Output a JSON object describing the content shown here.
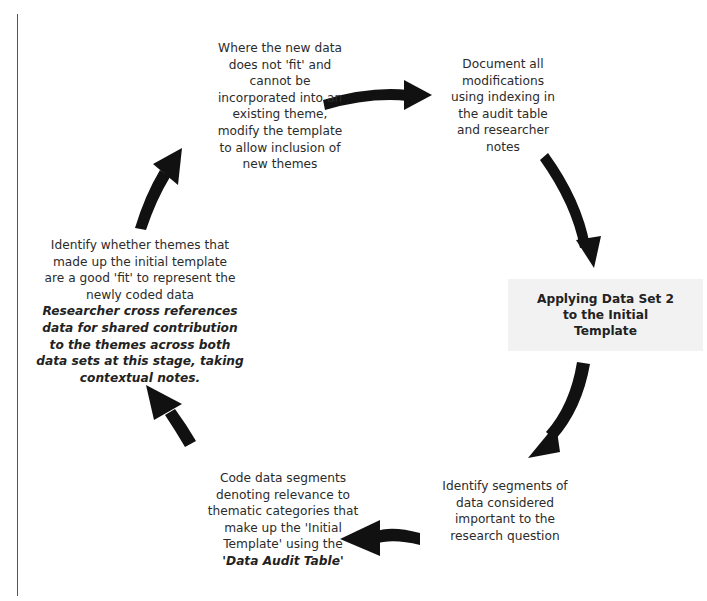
{
  "diagram": {
    "type": "cycle",
    "center_box": {
      "label": "Applying Data Set 2 to the Initial Template"
    },
    "nodes": [
      {
        "id": "modify-template",
        "lines": [
          "Where the new data",
          "does not 'fit' and",
          "cannot be",
          "incorporated into an",
          "existing theme,",
          "modify the template",
          "to allow inclusion of",
          "new themes"
        ]
      },
      {
        "id": "document-modifications",
        "lines": [
          "Document all",
          "modifications",
          "using indexing in",
          "the audit table",
          "and researcher",
          "notes"
        ]
      },
      {
        "id": "identify-segments",
        "lines": [
          "Identify segments of",
          "data considered",
          "important to the",
          "research question"
        ]
      },
      {
        "id": "code-segments",
        "lines": [
          "Code data segments",
          "denoting relevance to",
          "thematic categories that",
          "make up the 'Initial",
          "Template' using the"
        ],
        "emphasis": "'Data Audit Table'"
      },
      {
        "id": "identify-themes-fit",
        "lines": [
          "Identify whether themes that",
          "made up the initial template",
          "are a good 'fit' to represent the",
          "newly coded data"
        ],
        "emphasis_lines": [
          "Researcher cross references",
          "data for shared contribution",
          "to the themes across both",
          "data sets at this stage, taking",
          "contextual notes."
        ]
      }
    ],
    "arrows": [
      {
        "from": "modify-template",
        "to": "document-modifications",
        "direction": "right"
      },
      {
        "from": "document-modifications",
        "to": "center_box",
        "direction": "down"
      },
      {
        "from": "center_box",
        "to": "identify-segments",
        "direction": "down-left"
      },
      {
        "from": "identify-segments",
        "to": "code-segments",
        "direction": "left"
      },
      {
        "from": "code-segments",
        "to": "identify-themes-fit",
        "direction": "up-left"
      },
      {
        "from": "identify-themes-fit",
        "to": "modify-template",
        "direction": "up-right"
      }
    ],
    "colors": {
      "arrow": "#111111",
      "text": "#2b2b2b",
      "center_box_bg": "#f2f2f2",
      "border": "#555555"
    }
  }
}
